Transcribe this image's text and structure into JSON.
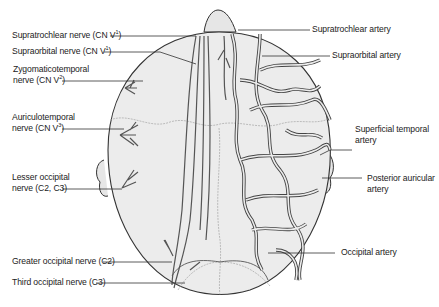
{
  "figure": {
    "left_labels": [
      {
        "id": "supratrochlear-nerve",
        "text": "Supratrochlear nerve (CN V",
        "sup": "1",
        "close": ")"
      },
      {
        "id": "supraorbital-nerve",
        "text": "Supraorbital nerve (CN V",
        "sup": "1",
        "close": ")"
      },
      {
        "id": "zygomaticotemporal-nerve",
        "line1": "Zygomaticotemporal",
        "text": "nerve (CN V",
        "sup": "2",
        "close": ")"
      },
      {
        "id": "auriculotemporal-nerve",
        "line1": "Auriculotemporal",
        "text": "nerve (CN V",
        "sup": "3",
        "close": ")"
      },
      {
        "id": "lesser-occipital-nerve",
        "line1": "Lesser occipital",
        "text": "nerve (C2, C3)"
      },
      {
        "id": "greater-occipital-nerve",
        "text": "Greater occipital nerve (C2)"
      },
      {
        "id": "third-occipital-nerve",
        "text": "Third occipital nerve (C3)"
      }
    ],
    "right_labels": [
      {
        "id": "supratrochlear-artery",
        "text": "Supratrochlear artery"
      },
      {
        "id": "supraorbital-artery",
        "text": "Supraorbital artery"
      },
      {
        "id": "superficial-temporal-artery",
        "line1": "Superficial temporal",
        "line2": "artery"
      },
      {
        "id": "posterior-auricular-artery",
        "line1": "Posterior auricular",
        "line2": "artery"
      },
      {
        "id": "occipital-artery",
        "text": "Occipital artery"
      }
    ],
    "colors": {
      "skull_fill": "#ececec",
      "outline": "#333333",
      "vessel": "#6a6a6a",
      "leader": "#333333"
    }
  }
}
